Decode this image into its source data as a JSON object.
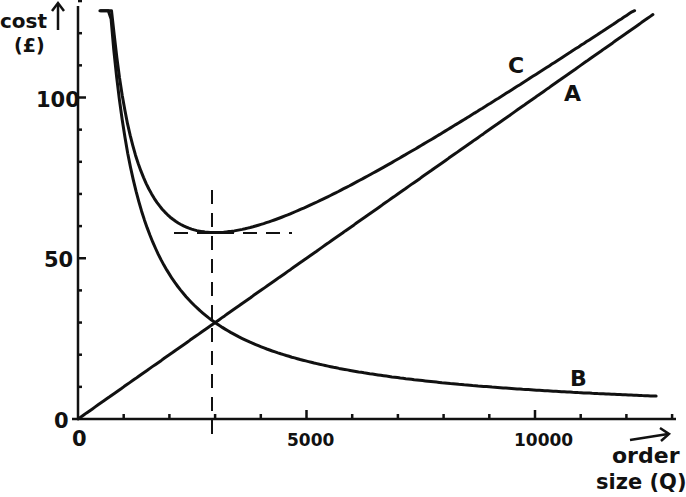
{
  "chart_data": {
    "type": "line",
    "title": "",
    "xlabel": "order size (Q)",
    "ylabel": "cost (£)",
    "xlim": [
      0,
      13000
    ],
    "ylim": [
      0,
      130
    ],
    "x_ticks": [
      0,
      1000,
      2000,
      3000,
      4000,
      5000,
      6000,
      7000,
      8000,
      9000,
      10000,
      11000,
      12000,
      13000
    ],
    "x_tick_labels": {
      "0": "0",
      "5000": "5000",
      "10000": "10000"
    },
    "y_ticks": [
      0,
      10,
      20,
      30,
      40,
      50,
      60,
      70,
      80,
      90,
      100,
      110,
      120,
      130
    ],
    "y_tick_labels": {
      "0": "0",
      "50": "50",
      "100": "100"
    },
    "grid": false,
    "legend": "inline labels",
    "series": [
      {
        "name": "A",
        "description": "holding cost (linear)",
        "x": [
          0,
          2000,
          3000,
          5000,
          8000,
          10000,
          12500
        ],
        "values": [
          0,
          20,
          30,
          50,
          80,
          100,
          125
        ]
      },
      {
        "name": "B",
        "description": "ordering cost (hyperbolic)",
        "x": [
          500,
          750,
          1000,
          1500,
          2000,
          3000,
          5000,
          8000,
          10000,
          12500
        ],
        "values": [
          130,
          120,
          90,
          60,
          45,
          30,
          18,
          11.3,
          9,
          8.6
        ]
      },
      {
        "name": "C",
        "description": "total cost = A + B",
        "x": [
          520,
          750,
          1000,
          1500,
          2000,
          3000,
          5000,
          8000,
          10000,
          12000
        ],
        "values": [
          130,
          127.5,
          100,
          75,
          65,
          58,
          68,
          91,
          109,
          128
        ]
      }
    ],
    "annotations": [
      {
        "type": "vline-dashed",
        "x": 3000,
        "label": "EOQ"
      },
      {
        "type": "hline-dashed",
        "y": 58,
        "x_range": [
          2100,
          4700
        ]
      },
      {
        "type": "point",
        "x": 3000,
        "y": 30,
        "label": "A = B intersection"
      }
    ]
  },
  "labels": {
    "y_axis_line1": "cost",
    "y_axis_line2": "(£)",
    "x_axis_line1": "order",
    "x_axis_line2": "size (Q)",
    "curve_a": "A",
    "curve_b": "B",
    "curve_c": "C",
    "tick_0_y": "0",
    "tick_50": "50",
    "tick_100": "100",
    "tick_0_x": "0",
    "tick_5000": "5000",
    "tick_10000": "10000"
  }
}
